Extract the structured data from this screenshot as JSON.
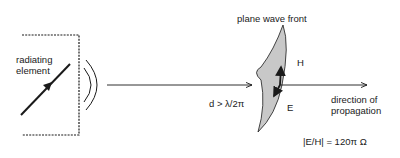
{
  "diagram": {
    "source": {
      "label_line1": "radiating",
      "label_line2": "element"
    },
    "distance_label": "d > λ/2π",
    "wavefront": {
      "title": "plane wave front",
      "h_label": "H",
      "e_label": "E"
    },
    "propagation": {
      "label_line1": "direction of",
      "label_line2": "propagation"
    },
    "impedance": "|E/H|  = 120π Ω",
    "colors": {
      "stroke": "#1a1a1a",
      "wavefront_fill": "#c8c8c8"
    }
  }
}
